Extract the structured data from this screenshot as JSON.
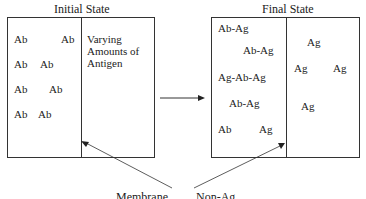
{
  "initial": {
    "title": "Initial State",
    "left_labels": [
      "Ab",
      "Ab",
      "Ab",
      "Ab",
      "Ab",
      "Ab",
      "Ab",
      "Ab"
    ],
    "right_text": [
      "Varying",
      "Amounts of",
      "Antigen"
    ]
  },
  "final": {
    "title": "Final State",
    "left_labels": [
      "Ab-Ag",
      "Ab-Ag",
      "Ag-Ab-Ag",
      "Ab-Ag",
      "Ab",
      "Ag"
    ],
    "right_labels": [
      "Ag",
      "Ag",
      "Ag",
      "Ag"
    ]
  },
  "caption": {
    "left": "Membrane",
    "right": "Non-Ag..."
  }
}
